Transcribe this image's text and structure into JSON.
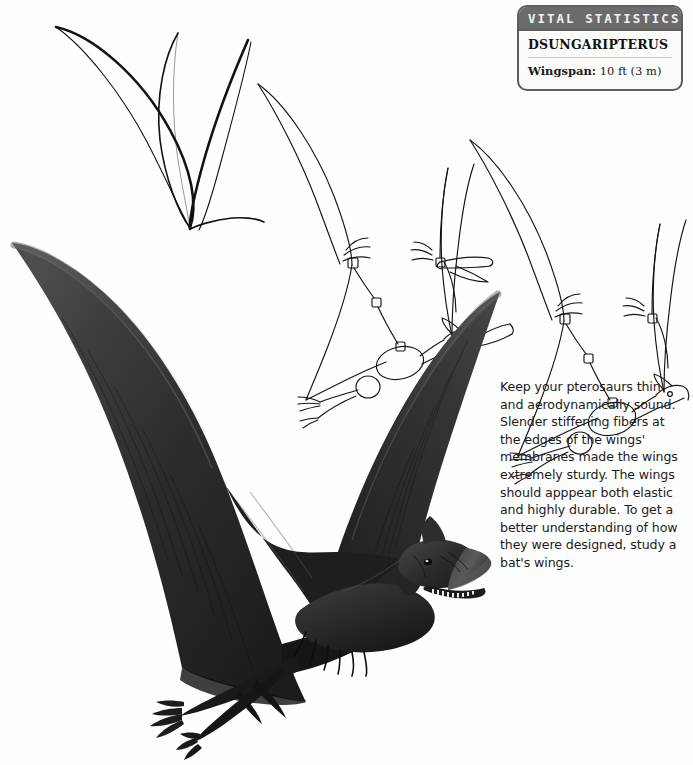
{
  "page": {
    "background_color": "#fefefe",
    "width": 693,
    "height": 765
  },
  "vital_statistics": {
    "header_label": "VITAL STATISTICS",
    "header_bg_color": "#6b6b6b",
    "border_color": "#5e5e5e",
    "species_name": "DSUNGARIPTERUS",
    "stats": [
      {
        "label": "Wingspan:",
        "value": "10 ft (3 m)"
      }
    ]
  },
  "tip": {
    "text": "Keep your pterosaurs thin and aerodynamically sound. Slender stiffening fibers at the edges of the wings' membranes made the wings extremely sturdy. The wings should apppear both elastic and highly durable. To get a better understanding of how they were designed, study a bat's wings."
  },
  "illustrations": [
    {
      "name": "wing-outline-sketch",
      "description": "Loose V-shaped contour line sketch of a pair of pterosaur wings, top-left",
      "style": "outline",
      "stroke_color": "#111111"
    },
    {
      "name": "skeletal-construction-sketch",
      "description": "Line sketch of pterosaur with wing-finger armature, body mass ovals and head blocked in",
      "style": "outline",
      "stroke_color": "#111111"
    },
    {
      "name": "refined-line-sketch",
      "description": "Refined line drawing of Dsungaripterus with head crest, beak and leg details",
      "style": "outline",
      "stroke_color": "#111111"
    },
    {
      "name": "finished-pterosaur-rendering",
      "description": "Fully rendered dark gray-black Dsungaripterus in flight with broad membranous wings, toothed upturned beak, head crest and clawed feet",
      "style": "shaded",
      "fill_color": "#2a2a2a"
    }
  ]
}
